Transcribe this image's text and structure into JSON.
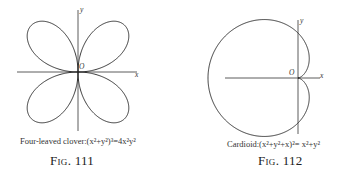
{
  "figures": [
    {
      "id": "fig111",
      "label": "Fig. 111",
      "caption": "Four-leaved clover:(x²+y²)³=4x²y²",
      "axis_labels": {
        "x": "x",
        "y": "y",
        "origin": "O"
      },
      "curve": "four-leaved clover"
    },
    {
      "id": "fig112",
      "label": "Fig. 112",
      "caption": "Cardioid:(x²+y²+x)²= x²+y²",
      "axis_labels": {
        "x": "x",
        "y": "y",
        "origin": "O"
      },
      "curve": "cardioid"
    }
  ]
}
